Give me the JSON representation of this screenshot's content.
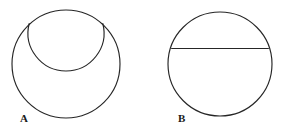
{
  "figure": {
    "background_color": "#ffffff",
    "stroke_color": "#262626",
    "label_color": "#1a1a1a",
    "width": 291,
    "height": 130
  },
  "panels": [
    {
      "id": "A",
      "label": "A",
      "label_x": 20,
      "label_y": 122,
      "description": "Large circle containing an inner arc of a smaller circle tangent internally at the top",
      "outer_circle": {
        "name": "outer-circle",
        "cx": 66,
        "cy": 64,
        "r": 54
      },
      "inner_arc": {
        "name": "inner-arc",
        "cx": 66,
        "cy": 33,
        "r": 38,
        "path": "M 29.2 23.5 A 38 38 0 1 0 102.8 23.5"
      }
    },
    {
      "id": "B",
      "label": "B",
      "label_x": 178,
      "label_y": 122,
      "description": "Circle with a horizontal chord drawn above the centre",
      "outer_circle": {
        "name": "outer-circle",
        "cx": 220,
        "cy": 64,
        "r": 52
      },
      "chord": {
        "name": "horizontal-chord",
        "x1": 171.6,
        "y1": 48.5,
        "x2": 268.4,
        "y2": 48.5
      }
    }
  ]
}
